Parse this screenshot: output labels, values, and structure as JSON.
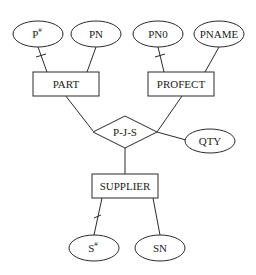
{
  "diagram": {
    "type": "er-diagram",
    "entities": [
      {
        "id": "part",
        "label": "PART"
      },
      {
        "id": "profect",
        "label": "PROFECT"
      },
      {
        "id": "supplier",
        "label": "SUPPLIER"
      }
    ],
    "relationship": {
      "id": "pjs",
      "label": "P-J-S"
    },
    "attributes": [
      {
        "id": "p_num",
        "label": "P#",
        "base": "P",
        "sup": "#",
        "owner": "part",
        "key": true
      },
      {
        "id": "pn",
        "label": "PN",
        "owner": "part",
        "key": false
      },
      {
        "id": "pn0",
        "label": "PN0",
        "owner": "profect",
        "key": true
      },
      {
        "id": "pname",
        "label": "PNAME",
        "owner": "profect",
        "key": false
      },
      {
        "id": "qty",
        "label": "QTY",
        "owner": "pjs",
        "key": false
      },
      {
        "id": "s_num",
        "label": "S#",
        "base": "S",
        "sup": "#",
        "owner": "supplier",
        "key": true
      },
      {
        "id": "sn",
        "label": "SN",
        "owner": "supplier",
        "key": false
      }
    ],
    "colors": {
      "stroke": "#2a2a2a",
      "text": "#222222",
      "background": "#ffffff"
    }
  }
}
